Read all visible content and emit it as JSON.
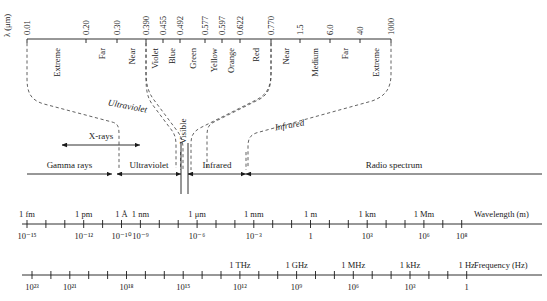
{
  "figure": {
    "type": "electromagnetic-spectrum-diagram",
    "title": "",
    "background": "#ffffff",
    "ink": "#1a1a1a"
  },
  "top_axis": {
    "axis_title": "λ (μm)",
    "tick_values": [
      "0.01",
      "0.20",
      "0.30",
      "0.390",
      "0.455",
      "0.492",
      "0.577",
      "0.597",
      "0.622",
      "0.770",
      "1.5",
      "6.0",
      "40",
      "1000"
    ],
    "band_labels": [
      "Extreme",
      "Far",
      "Near",
      "Violet",
      "Blue",
      "Green",
      "Yellow",
      "Orange",
      "Red",
      "Near",
      "Medium",
      "Far",
      "Extreme"
    ]
  },
  "slanted_labels": {
    "ultraviolet": "Ultraviolet",
    "visible": "Visible",
    "infrared": "Infrared"
  },
  "xray": {
    "label": "X-rays"
  },
  "main_band": {
    "segments": [
      "Gamma rays",
      "Ultraviolet",
      "Infrared",
      "Radio spectrum"
    ]
  },
  "wavelength_axis": {
    "axis_title": "Wavelength (m)",
    "unit_labels": [
      "1 fm",
      "1 pm",
      "1 Å",
      "1 nm",
      "1 μm",
      "1 mm",
      "1 m",
      "1 km",
      "1 Mm"
    ],
    "power_labels": [
      "10⁻¹⁵",
      "10⁻¹²",
      "10⁻¹⁰",
      "10⁻⁹",
      "10⁻⁶",
      "10⁻³",
      "1",
      "10³",
      "10⁶",
      "10⁸"
    ]
  },
  "frequency_axis": {
    "axis_title": "Frequency (Hz)",
    "unit_labels": [
      "1 THz",
      "1 GHz",
      "1 MHz",
      "1 kHz",
      "1 Hz"
    ],
    "power_labels": [
      "10²³",
      "10²¹",
      "10¹⁸",
      "10¹⁵",
      "10¹²",
      "10⁹",
      "10⁶",
      "10³",
      "1"
    ]
  },
  "chart_data": {
    "type": "table",
    "xlabel": "Wavelength (m) / Frequency (Hz)",
    "ylabel": "",
    "top_scale": {
      "name": "λ (μm)",
      "ticks": [
        0.01,
        0.2,
        0.3,
        0.39,
        0.455,
        0.492,
        0.577,
        0.597,
        0.622,
        0.77,
        1.5,
        6.0,
        40,
        1000
      ],
      "regions": [
        {
          "name": "Extreme",
          "group": "Ultraviolet",
          "from": 0.01,
          "to": 0.2
        },
        {
          "name": "Far",
          "group": "Ultraviolet",
          "from": 0.2,
          "to": 0.3
        },
        {
          "name": "Near",
          "group": "Ultraviolet",
          "from": 0.3,
          "to": 0.39
        },
        {
          "name": "Violet",
          "group": "Visible",
          "from": 0.39,
          "to": 0.455
        },
        {
          "name": "Blue",
          "group": "Visible",
          "from": 0.455,
          "to": 0.492
        },
        {
          "name": "Green",
          "group": "Visible",
          "from": 0.492,
          "to": 0.577
        },
        {
          "name": "Yellow",
          "group": "Visible",
          "from": 0.577,
          "to": 0.597
        },
        {
          "name": "Orange",
          "group": "Visible",
          "from": 0.597,
          "to": 0.622
        },
        {
          "name": "Red",
          "group": "Visible",
          "from": 0.622,
          "to": 0.77
        },
        {
          "name": "Near",
          "group": "Infrared",
          "from": 0.77,
          "to": 1.5
        },
        {
          "name": "Medium",
          "group": "Infrared",
          "from": 1.5,
          "to": 6.0
        },
        {
          "name": "Far",
          "group": "Infrared",
          "from": 6.0,
          "to": 40
        },
        {
          "name": "Extreme",
          "group": "Infrared",
          "from": 40,
          "to": 1000
        }
      ]
    },
    "main_bands": [
      "Gamma rays",
      "X-rays",
      "Ultraviolet",
      "Visible",
      "Infrared",
      "Radio spectrum"
    ],
    "wavelength_decades": [
      -15,
      -14,
      -13,
      -12,
      -11,
      -10,
      -9,
      -8,
      -7,
      -6,
      -5,
      -4,
      -3,
      -2,
      -1,
      0,
      1,
      2,
      3,
      4,
      5,
      6,
      7,
      8
    ],
    "wavelength_marked": [
      {
        "label": "1 fm",
        "exponent": -15
      },
      {
        "label": "1 pm",
        "exponent": -12
      },
      {
        "label": "1 Å",
        "exponent": -10
      },
      {
        "label": "1 nm",
        "exponent": -9
      },
      {
        "label": "1 μm",
        "exponent": -6
      },
      {
        "label": "1 mm",
        "exponent": -3
      },
      {
        "label": "1 m",
        "exponent": 0
      },
      {
        "label": "1 km",
        "exponent": 3
      },
      {
        "label": "1 Mm",
        "exponent": 6
      }
    ],
    "frequency_marked": [
      {
        "label": "1 THz",
        "exponent": 12
      },
      {
        "label": "1 GHz",
        "exponent": 9
      },
      {
        "label": "1 MHz",
        "exponent": 6
      },
      {
        "label": "1 kHz",
        "exponent": 3
      },
      {
        "label": "1 Hz",
        "exponent": 0
      }
    ],
    "frequency_decades": [
      23,
      22,
      21,
      20,
      19,
      18,
      17,
      16,
      15,
      14,
      13,
      12,
      11,
      10,
      9,
      8,
      7,
      6,
      5,
      4,
      3,
      2,
      1,
      0
    ]
  }
}
